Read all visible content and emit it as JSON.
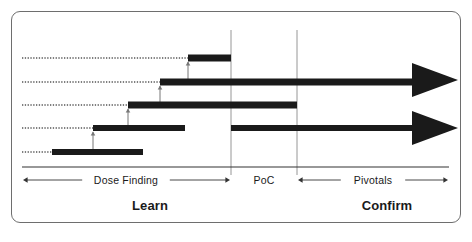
{
  "diagram": {
    "background_color": "#ffffff",
    "frame_color": "#6e6e6e",
    "bar_color": "#1a1a1a",
    "dotted_color": "#555555",
    "gridline_color": "#8a8a8a",
    "axis_color": "#333333"
  },
  "axis": {
    "baseline_y": 167,
    "segments": [
      {
        "id": "dose-finding",
        "label": "Dose Finding",
        "x_start": 22,
        "x_end": 231,
        "label_x": 126,
        "arrows": "both"
      },
      {
        "id": "poc",
        "label": "PoC",
        "x_start": 231,
        "x_end": 297,
        "label_x": 264,
        "arrows": "none"
      },
      {
        "id": "pivotals",
        "label": "Pivotals",
        "x_start": 297,
        "x_end": 449,
        "label_x": 373,
        "arrows": "both"
      }
    ]
  },
  "phases": [
    {
      "id": "learn",
      "label": "Learn",
      "x": 150,
      "y": 205
    },
    {
      "id": "confirm",
      "label": "Confirm",
      "x": 387,
      "y": 205
    }
  ],
  "gridlines": [
    {
      "id": "poc-start",
      "x": 231,
      "y_top": 30,
      "y_bottom": 175
    },
    {
      "id": "pivotals-start",
      "x": 297,
      "y_top": 30,
      "y_bottom": 175
    }
  ],
  "study_rows": [
    {
      "id": "row-1-highest-dose",
      "y": 58,
      "dotted_x_start": 22,
      "dotted_x_end": 188,
      "bar_x_start": 188,
      "bar_x_end": 231,
      "bar_thickness": 7,
      "has_arrowhead": false
    },
    {
      "id": "row-2-poc-cohort",
      "y": 82,
      "dotted_x_start": 22,
      "dotted_x_end": 160,
      "bar_x_start": 160,
      "bar_x_end": 414,
      "bar_thickness": 7,
      "has_arrowhead": true
    },
    {
      "id": "row-3-mid-dose",
      "y": 105,
      "dotted_x_start": 22,
      "dotted_x_end": 128,
      "bar_x_start": 128,
      "bar_x_end": 297,
      "bar_thickness": 7,
      "has_arrowhead": false
    },
    {
      "id": "row-4-pivotal-cohort",
      "y": 128,
      "dotted_x_start": 22,
      "dotted_x_end": 93,
      "bar_x_start": 93,
      "bar_x_end": 414,
      "bar_thickness": 6,
      "bar_gap_start": 185,
      "bar_gap_end": 231,
      "has_arrowhead": true
    },
    {
      "id": "row-5-starting-dose",
      "y": 152,
      "dotted_x_start": 22,
      "dotted_x_end": 52,
      "bar_x_start": 52,
      "bar_x_end": 143,
      "bar_thickness": 6,
      "has_arrowhead": false
    }
  ],
  "escalation_connectors": [
    {
      "id": "connector-1",
      "x": 188,
      "y_from": 82,
      "y_to": 62
    },
    {
      "id": "connector-2",
      "x": 160,
      "y_from": 105,
      "y_to": 86
    },
    {
      "id": "connector-3",
      "x": 128,
      "y_from": 128,
      "y_to": 109
    },
    {
      "id": "connector-4",
      "x": 93,
      "y_from": 152,
      "y_to": 132
    }
  ],
  "arrowheads": [
    {
      "id": "arrowhead-poc",
      "tip_x": 458,
      "back_x": 412,
      "center_y": 80,
      "half_height": 17
    },
    {
      "id": "arrowhead-pivotal",
      "tip_x": 458,
      "back_x": 412,
      "center_y": 128,
      "half_height": 17
    }
  ]
}
